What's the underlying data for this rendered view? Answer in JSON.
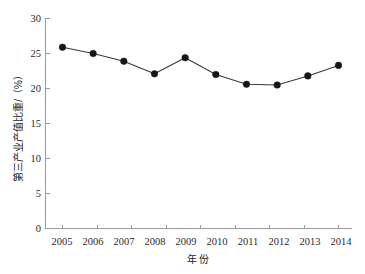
{
  "chart_data": {
    "type": "line",
    "title": "",
    "subtitle": "",
    "xlabel": "年  份",
    "ylabel": "第三产业产值比重/（%）",
    "categories": [
      "2005",
      "2006",
      "2007",
      "2008",
      "2009",
      "2010",
      "2011",
      "2012",
      "2013",
      "2014"
    ],
    "x": [
      2005,
      2006,
      2007,
      2008,
      2009,
      2010,
      2011,
      2012,
      2013,
      2014
    ],
    "values": [
      25.9,
      25.0,
      23.9,
      22.1,
      24.4,
      22.0,
      20.6,
      20.5,
      21.8,
      23.3
    ],
    "series": [
      {
        "name": "第三产业产值比重",
        "values": [
          25.9,
          25.0,
          23.9,
          22.1,
          24.4,
          22.0,
          20.6,
          20.5,
          21.8,
          23.3
        ]
      }
    ],
    "ylim": [
      0,
      30
    ],
    "yticks": [
      0,
      5,
      10,
      15,
      20,
      25,
      30
    ],
    "ytick_labels": [
      "0",
      "5",
      "10",
      "15",
      "20",
      "25",
      "30"
    ],
    "xtick_labels": [
      "2005",
      "2006",
      "2007",
      "2008",
      "2009",
      "2010",
      "2011",
      "2012",
      "2013",
      "2014"
    ],
    "grid": false,
    "legend": false,
    "legend_position": "none",
    "marker": "filled-circle",
    "line_color": "#3a3a3a",
    "marker_color": "#161616",
    "axis_color": "#9a9a9a",
    "background_color": "#ffffff"
  },
  "axes": {
    "y_axis_title": "第三产业产值比重/（%）",
    "x_axis_title": "年  份",
    "y_tick_0": "0",
    "y_tick_1": "5",
    "y_tick_2": "10",
    "y_tick_3": "15",
    "y_tick_4": "20",
    "y_tick_5": "25",
    "y_tick_6": "30",
    "x_tick_0": "2005",
    "x_tick_1": "2006",
    "x_tick_2": "2007",
    "x_tick_3": "2008",
    "x_tick_4": "2009",
    "x_tick_5": "2010",
    "x_tick_6": "2011",
    "x_tick_7": "2012",
    "x_tick_8": "2013",
    "x_tick_9": "2014"
  }
}
